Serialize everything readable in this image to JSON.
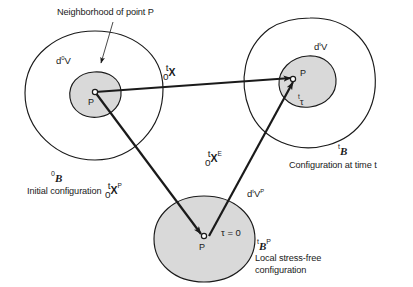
{
  "figure": {
    "title_annotation": "Neighborhood of point P",
    "colors": {
      "stroke": "#1a1a1a",
      "fill_highlight": "#d9d9d9",
      "background": "#ffffff",
      "text": "#1a1a1a"
    }
  },
  "initial_configuration": {
    "volume_label": {
      "base": "d",
      "superscript": "0",
      "symbol": "V"
    },
    "point_label": "P",
    "body_symbol": {
      "presuperscript": "0",
      "letter": "B"
    },
    "caption": "Initial configuration"
  },
  "current_configuration": {
    "volume_label": {
      "base": "d",
      "superscript": "t",
      "symbol": "V"
    },
    "point_label": "P",
    "stress_label": {
      "presuperscript": "t",
      "symbol": "τ"
    },
    "body_symbol": {
      "presuperscript": "t",
      "letter": "B"
    },
    "caption": "Configuration at time t"
  },
  "stress_free_configuration": {
    "volume_label": {
      "base": "d",
      "superscript": "t",
      "symbol": "V",
      "postsuperscript": "P"
    },
    "point_label": "P",
    "stress_value": "τ = 0",
    "body_symbol": {
      "presuperscript": "t",
      "letter": "B",
      "postsuperscript": "P"
    },
    "caption_line1": "Local stress-free",
    "caption_line2": "configuration"
  },
  "vectors": [
    {
      "name": "total-deformation-vector",
      "presuperscript": "t",
      "presubscript": "0",
      "symbol": "X",
      "postsuperscript": ""
    },
    {
      "name": "plastic-deformation-vector",
      "presuperscript": "t",
      "presubscript": "0",
      "symbol": "X",
      "postsuperscript": "P"
    },
    {
      "name": "elastic-deformation-vector",
      "presuperscript": "t",
      "presubscript": "0",
      "symbol": "X",
      "postsuperscript": "E"
    }
  ]
}
